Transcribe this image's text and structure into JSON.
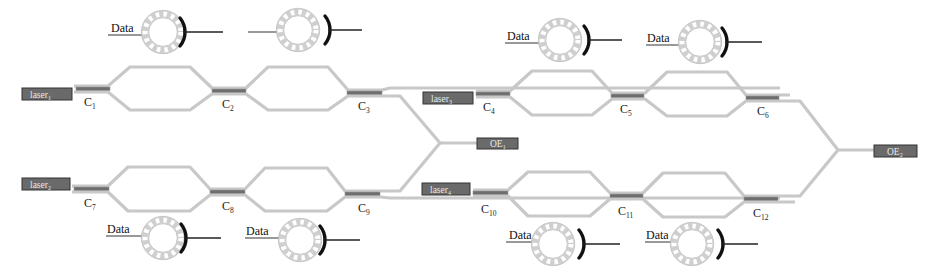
{
  "diagram": {
    "type": "photonic-circuit",
    "colors": {
      "waveguide": "#c8c8c8",
      "coupler": "#6e6e6e",
      "box_fill": "#6a6a6a",
      "box_text": "#e8e8e8",
      "electrode": "#111111",
      "ring": "#cfcfcf"
    },
    "lasers": [
      {
        "id": "laser1",
        "label": "laser",
        "sub": "1"
      },
      {
        "id": "laser2",
        "label": "laser",
        "sub": "2"
      },
      {
        "id": "laser3",
        "label": "laser",
        "sub": "3"
      },
      {
        "id": "laser4",
        "label": "laser",
        "sub": "4"
      }
    ],
    "receivers": [
      {
        "id": "oe1",
        "label": "OE",
        "sub": "1"
      },
      {
        "id": "oe2",
        "label": "OE",
        "sub": "2"
      }
    ],
    "couplers": [
      {
        "label": "C",
        "sub": "1"
      },
      {
        "label": "C",
        "sub": "2"
      },
      {
        "label": "C",
        "sub": "3"
      },
      {
        "label": "C",
        "sub": "4"
      },
      {
        "label": "C",
        "sub": "5"
      },
      {
        "label": "C",
        "sub": "6"
      },
      {
        "label": "C",
        "sub": "7"
      },
      {
        "label": "C",
        "sub": "8"
      },
      {
        "label": "C",
        "sub": "9"
      },
      {
        "label": "C",
        "sub": "10"
      },
      {
        "label": "C",
        "sub": "11"
      },
      {
        "label": "C",
        "sub": "12"
      }
    ],
    "modulators": [
      {
        "position": "top-1",
        "data_label": "Data"
      },
      {
        "position": "top-2",
        "data_label": ""
      },
      {
        "position": "top-3",
        "data_label": "Data"
      },
      {
        "position": "top-4",
        "data_label": "Data"
      },
      {
        "position": "bottom-1",
        "data_label": "Data"
      },
      {
        "position": "bottom-2",
        "data_label": "Data"
      },
      {
        "position": "bottom-3",
        "data_label": "Data"
      },
      {
        "position": "bottom-4",
        "data_label": "Data"
      }
    ]
  }
}
